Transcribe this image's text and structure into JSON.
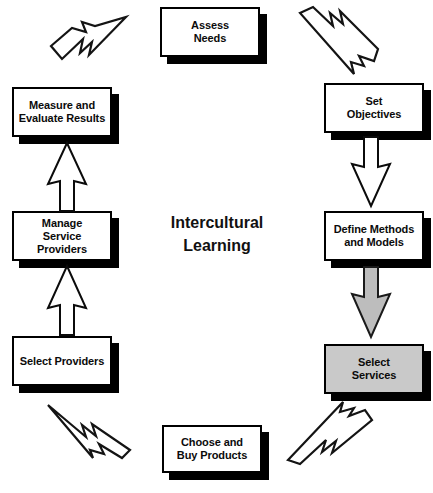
{
  "diagram": {
    "title": "Intercultural Learning",
    "centre_caption": "Intercultural\nLearning",
    "type": "cycle-flowchart",
    "colors": {
      "box_fill": "#ffffff",
      "box_highlight_fill": "#c9c9c9",
      "outline": "#000000",
      "shadow": "#000000",
      "arrow_fill": "#ffffff",
      "arrow_highlight_fill": "#bdbdbd"
    },
    "nodes": [
      {
        "id": "assess-needs",
        "label": "Assess\nNeeds",
        "highlighted": false,
        "x": 160,
        "y": 7,
        "w": 100,
        "h": 50
      },
      {
        "id": "set-objectives",
        "label": "Set\nObjectives",
        "highlighted": false,
        "x": 324,
        "y": 83,
        "w": 100,
        "h": 50
      },
      {
        "id": "define-methods-models",
        "label": "Define  Methods\nand Models",
        "highlighted": false,
        "x": 324,
        "y": 211,
        "w": 100,
        "h": 50
      },
      {
        "id": "select-services",
        "label": "Select\nServices",
        "highlighted": true,
        "x": 324,
        "y": 344,
        "w": 100,
        "h": 50
      },
      {
        "id": "choose-buy-products",
        "label": "Choose and\nBuy Products",
        "highlighted": false,
        "x": 162,
        "y": 425,
        "w": 100,
        "h": 48
      },
      {
        "id": "select-providers",
        "label": "Select Providers",
        "highlighted": false,
        "x": 12,
        "y": 336,
        "w": 100,
        "h": 50
      },
      {
        "id": "manage-service-providers",
        "label": "Manage\nService Providers",
        "highlighted": false,
        "x": 12,
        "y": 211,
        "w": 100,
        "h": 50
      },
      {
        "id": "measure-evaluate-results",
        "label": "Measure and\nEvaluate Results",
        "highlighted": false,
        "x": 12,
        "y": 87,
        "w": 100,
        "h": 50
      }
    ],
    "connectors": [
      {
        "id": "choose-products-to-select-providers",
        "style": "jagged",
        "direction": "up-left",
        "from": "choose-buy-products",
        "to": "select-providers"
      },
      {
        "id": "select-providers-to-manage-providers",
        "style": "block",
        "direction": "up",
        "from": "select-providers",
        "to": "manage-service-providers"
      },
      {
        "id": "manage-providers-to-measure-evaluate",
        "style": "block",
        "direction": "up",
        "from": "manage-service-providers",
        "to": "measure-evaluate-results"
      },
      {
        "id": "measure-evaluate-to-assess-needs",
        "style": "jagged",
        "direction": "up-right",
        "from": "measure-evaluate-results",
        "to": "assess-needs"
      },
      {
        "id": "assess-needs-to-set-objectives",
        "style": "jagged",
        "direction": "down-right",
        "from": "assess-needs",
        "to": "set-objectives"
      },
      {
        "id": "set-objectives-to-define-methods",
        "style": "block",
        "direction": "down",
        "from": "set-objectives",
        "to": "define-methods-models"
      },
      {
        "id": "define-methods-to-select-services",
        "style": "block-filled",
        "direction": "down",
        "from": "define-methods-models",
        "to": "select-services"
      },
      {
        "id": "select-services-to-choose-products",
        "style": "jagged",
        "direction": "down-left",
        "from": "select-services",
        "to": "choose-buy-products"
      }
    ]
  }
}
